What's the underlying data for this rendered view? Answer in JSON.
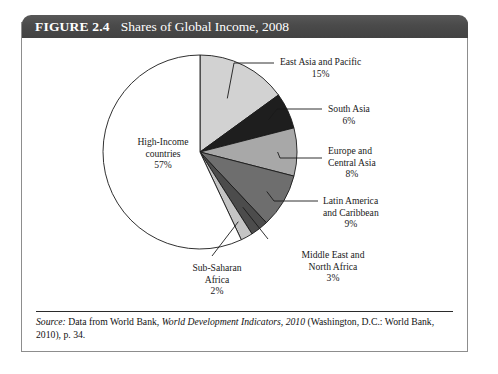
{
  "figure": {
    "number_label": "FIGURE 2.4",
    "title": "Shares of Global Income, 2008"
  },
  "source": {
    "prefix": "Source:",
    "text_before_italic": " Data from World Bank, ",
    "italic_title": "World Development Indicators, 2010",
    "text_after_italic": " (Washington, D.C.: World Bank, 2010), p. 34."
  },
  "chart_data": {
    "type": "pie",
    "title": "Shares of Global Income, 2008",
    "unit": "percent",
    "start_angle_deg": 0,
    "direction": "clockwise",
    "legend": "none",
    "categories": [
      "High-Income countries",
      "East Asia and Pacific",
      "South Asia",
      "Europe and Central Asia",
      "Latin America and Caribbean",
      "Middle East and North Africa",
      "Sub-Saharan Africa"
    ],
    "values": [
      57,
      15,
      6,
      8,
      9,
      3,
      2
    ],
    "slices": [
      {
        "name": "East Asia and Pacific",
        "label_line1": "East Asia and Pacific",
        "label_line2": "15%",
        "value": 15,
        "color": "#d2d2d2",
        "label_pos": "right"
      },
      {
        "name": "South Asia",
        "label_line1": "South Asia",
        "label_line2": "6%",
        "value": 6,
        "color": "#1e1e1e",
        "label_pos": "right"
      },
      {
        "name": "Europe and Central Asia",
        "label_line1": "Europe and",
        "label_line2": "Central Asia",
        "label_line3": "8%",
        "value": 8,
        "color": "#a8a8a8",
        "label_pos": "right"
      },
      {
        "name": "Latin America and Caribbean",
        "label_line1": "Latin America",
        "label_line2": "and Caribbean",
        "label_line3": "9%",
        "value": 9,
        "color": "#6e6e6e",
        "label_pos": "right"
      },
      {
        "name": "Middle East and North Africa",
        "label_line1": "Middle East and",
        "label_line2": "North Africa",
        "label_line3": "3%",
        "value": 3,
        "color": "#4c4c4c",
        "label_pos": "bottom-right"
      },
      {
        "name": "Sub-Saharan Africa",
        "label_line1": "Sub-Saharan",
        "label_line2": "Africa",
        "label_line3": "2%",
        "value": 2,
        "color": "#c4c4c4",
        "label_pos": "bottom"
      },
      {
        "name": "High-Income countries",
        "label_line1": "High-Income",
        "label_line2": "countries",
        "label_line3": "57%",
        "value": 57,
        "color": "#ffffff",
        "label_pos": "inside"
      }
    ],
    "geometry": {
      "center_x": 178,
      "center_y": 112,
      "radius": 97
    },
    "colors": {
      "outline": "#1a1a1a",
      "leader_line": "#1a1a1a",
      "banner": "#4a4a4a",
      "box_border": "#8d8d8d"
    }
  }
}
